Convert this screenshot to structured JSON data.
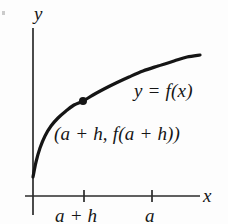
{
  "figure": {
    "kind": "line",
    "background_color": "#fdfdfd",
    "ink_color": "#151515",
    "axis_label_x": "x",
    "axis_label_y": "y",
    "curve_label": "y = f(x)",
    "point_label": "(a + h, f(a + h))",
    "tick_labels": [
      "a + h",
      "a"
    ],
    "scan_speck": ""
  },
  "chart_data": {
    "type": "line",
    "title": "",
    "subtitle": "",
    "xlabel": "x",
    "ylabel": "y",
    "grid": false,
    "legend": null,
    "axes": {
      "x_axis_y_px": 196,
      "y_axis_x_px": 33,
      "x_axis_start_px": 25,
      "x_axis_end_px": 200,
      "y_axis_top_px": 28,
      "y_axis_bottom_px": 215,
      "arrowheads": false,
      "xlim_px": [
        25,
        200
      ],
      "ylim_px": [
        28,
        215
      ]
    },
    "series": [
      {
        "name": "y = f(x)",
        "label": "y = f(x)",
        "shape": "increasing concave-down (square-root like)",
        "stroke_width_px": 3.2,
        "color": "#151515",
        "points_px": [
          [
            33,
            177
          ],
          [
            36,
            162
          ],
          [
            40,
            148
          ],
          [
            45,
            136
          ],
          [
            51,
            126
          ],
          [
            58,
            118
          ],
          [
            66,
            111
          ],
          [
            74,
            105
          ],
          [
            83,
            101
          ],
          [
            93,
            95
          ],
          [
            104,
            89
          ],
          [
            116,
            83
          ],
          [
            129,
            77
          ],
          [
            143,
            71
          ],
          [
            158,
            66
          ],
          [
            174,
            61
          ],
          [
            187,
            57
          ],
          [
            200,
            55
          ]
        ]
      }
    ],
    "points": [
      {
        "name": "(a + h, f(a + h))",
        "label": "(a + h, f(a + h))",
        "x_px": 83,
        "y_px": 101,
        "marker": "filled-circle",
        "radius_px": 4,
        "color": "#151515"
      }
    ],
    "x_ticks": [
      {
        "label": "a + h",
        "x_px": 84,
        "length_px": 12
      },
      {
        "label": "a",
        "x_px": 152,
        "length_px": 12
      }
    ],
    "y_ticks": [],
    "annotations": [
      {
        "text": "y = f(x)",
        "x_px": 134,
        "y_px": 92
      },
      {
        "text": "(a + h, f(a + h))",
        "x_px": 54,
        "y_px": 135
      }
    ]
  }
}
